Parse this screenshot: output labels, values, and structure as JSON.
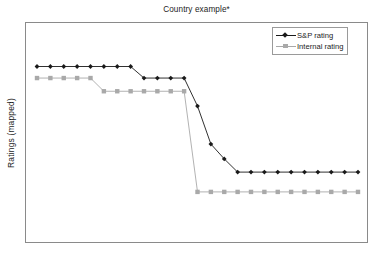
{
  "chart_data": {
    "type": "line",
    "title": "Country example*",
    "xlabel": "",
    "ylabel": "Ratings (mapped)",
    "grid": false,
    "legend_position": "top-right",
    "x_tick_labels": [],
    "y_tick_labels": [],
    "xlim": [
      0,
      24
    ],
    "ylim": [
      0,
      10
    ],
    "x": [
      0,
      1,
      2,
      3,
      4,
      5,
      6,
      7,
      8,
      9,
      10,
      11,
      12,
      13,
      14,
      15,
      16,
      17,
      18,
      19,
      20,
      21,
      22,
      23,
      24
    ],
    "series": [
      {
        "name": "S&P rating",
        "color": "#1a1a1a",
        "marker": "diamond",
        "values": [
          9,
          9,
          9,
          9,
          9,
          9,
          9,
          9,
          8.3,
          8.3,
          8.3,
          8.3,
          6.6,
          4.3,
          3.4,
          2.6,
          2.6,
          2.6,
          2.6,
          2.6,
          2.6,
          2.6,
          2.6,
          2.6,
          2.6
        ]
      },
      {
        "name": "Internal rating",
        "color": "#a9a9a9",
        "marker": "square",
        "values": [
          8.3,
          8.3,
          8.3,
          8.3,
          8.3,
          7.5,
          7.5,
          7.5,
          7.5,
          7.5,
          7.5,
          7.5,
          1.4,
          1.4,
          1.4,
          1.4,
          1.4,
          1.4,
          1.4,
          1.4,
          1.4,
          1.4,
          1.4,
          1.4,
          1.4
        ]
      }
    ]
  },
  "legend": {
    "entries": [
      {
        "label": "S&P rating"
      },
      {
        "label": "Internal rating"
      }
    ]
  },
  "footnote": {
    "text": ""
  },
  "colors": {
    "sp_rating": "#1a1a1a",
    "internal_rating": "#a9a9a9",
    "frame": "#8a8a8a",
    "background": "#ffffff"
  }
}
